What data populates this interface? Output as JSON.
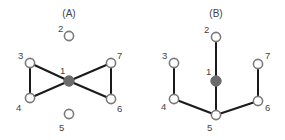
{
  "colors": {
    "edge": "#1a1a1a",
    "node_outline": "#7a7a7a",
    "node_center": "#6b6b6b",
    "label": "#444444"
  },
  "panels": [
    {
      "title": "(A)",
      "title_pos": [
        69,
        17
      ],
      "nodes": [
        {
          "id": "1",
          "x": 69,
          "y": 81,
          "filled": true,
          "lx": 60,
          "ly": 74
        },
        {
          "id": "2",
          "x": 69,
          "y": 36,
          "filled": false,
          "lx": 58,
          "ly": 32
        },
        {
          "id": "3",
          "x": 30,
          "y": 63,
          "filled": false,
          "lx": 18,
          "ly": 59
        },
        {
          "id": "4",
          "x": 30,
          "y": 98,
          "filled": false,
          "lx": 16,
          "ly": 111
        },
        {
          "id": "5",
          "x": 69,
          "y": 114,
          "filled": false,
          "lx": 59,
          "ly": 131
        },
        {
          "id": "6",
          "x": 111,
          "y": 99,
          "filled": false,
          "lx": 117,
          "ly": 112
        },
        {
          "id": "7",
          "x": 111,
          "y": 63,
          "filled": false,
          "lx": 117,
          "ly": 59
        }
      ],
      "edges": [
        [
          "3",
          "4"
        ],
        [
          "3",
          "1"
        ],
        [
          "4",
          "1"
        ],
        [
          "1",
          "7"
        ],
        [
          "1",
          "6"
        ],
        [
          "7",
          "6"
        ]
      ]
    },
    {
      "title": "(B)",
      "title_pos": [
        216,
        17
      ],
      "nodes": [
        {
          "id": "1",
          "x": 216,
          "y": 81,
          "filled": true,
          "lx": 206,
          "ly": 75
        },
        {
          "id": "2",
          "x": 216,
          "y": 37,
          "filled": false,
          "lx": 204,
          "ly": 33
        },
        {
          "id": "3",
          "x": 174,
          "y": 63,
          "filled": false,
          "lx": 162,
          "ly": 59
        },
        {
          "id": "4",
          "x": 174,
          "y": 99,
          "filled": false,
          "lx": 161,
          "ly": 110
        },
        {
          "id": "5",
          "x": 216,
          "y": 115,
          "filled": false,
          "lx": 207,
          "ly": 131
        },
        {
          "id": "6",
          "x": 258,
          "y": 101,
          "filled": false,
          "lx": 265,
          "ly": 111
        },
        {
          "id": "7",
          "x": 258,
          "y": 64,
          "filled": false,
          "lx": 265,
          "ly": 59
        }
      ],
      "edges": [
        [
          "2",
          "1"
        ],
        [
          "1",
          "5"
        ],
        [
          "3",
          "4"
        ],
        [
          "4",
          "5"
        ],
        [
          "5",
          "6"
        ],
        [
          "6",
          "7"
        ]
      ]
    }
  ]
}
